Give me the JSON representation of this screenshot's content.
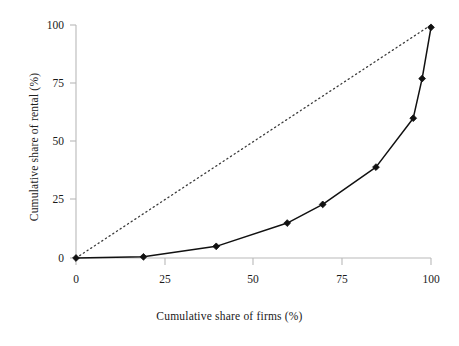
{
  "chart_data": {
    "type": "line",
    "title": "",
    "subtitle": "",
    "xlabel": "Cumulative share of firms (%)",
    "ylabel": "Cumulative share of rental (%)",
    "xlim": [
      0,
      100
    ],
    "ylim": [
      0,
      100
    ],
    "xticks": [
      0,
      25,
      50,
      75,
      100
    ],
    "yticks": [
      0,
      25,
      50,
      75,
      100
    ],
    "xtick_labels": [
      "0",
      "25",
      "50",
      "75",
      "100"
    ],
    "ytick_labels": [
      "0",
      "25",
      "50",
      "75",
      "100"
    ],
    "grid": false,
    "legend": false,
    "legend_position": "none",
    "annotations": [],
    "series": [
      {
        "name": "Lorenz curve",
        "style": "solid-line-with-diamond-markers",
        "color": "#111111",
        "marker": "diamond",
        "x": [
          0,
          19,
          39.5,
          59.5,
          69.5,
          84.5,
          95,
          97.5,
          100
        ],
        "y": [
          0,
          0.5,
          5,
          15,
          23,
          39,
          60,
          77,
          99
        ]
      },
      {
        "name": "Line of equality",
        "style": "dotted-line",
        "color": "#444444",
        "marker": "none",
        "x": [
          0,
          100
        ],
        "y": [
          0,
          100
        ]
      }
    ]
  },
  "axes": {
    "x_title": "Cumulative share of firms (%)",
    "y_title": "Cumulative share of rental (%)"
  },
  "corner": {
    "artifact": ""
  }
}
